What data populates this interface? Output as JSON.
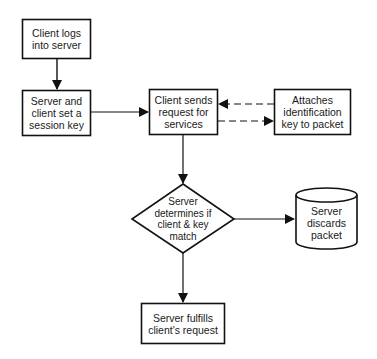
{
  "diagram": {
    "type": "flowchart",
    "nodes": {
      "login": {
        "shape": "rect",
        "lines": [
          "Client logs",
          "into server"
        ]
      },
      "session": {
        "shape": "rect",
        "lines": [
          "Server and",
          "client set a",
          "session key"
        ]
      },
      "request": {
        "shape": "rect",
        "lines": [
          "Client sends",
          "request for",
          "services"
        ]
      },
      "attach": {
        "shape": "rect",
        "lines": [
          "Attaches",
          "identification",
          "key to packet"
        ]
      },
      "decision": {
        "shape": "diamond",
        "lines": [
          "Server",
          "determines if",
          "client & key",
          "match"
        ]
      },
      "discard": {
        "shape": "cylinder",
        "lines": [
          "Server",
          "discards",
          "packet"
        ]
      },
      "fulfill": {
        "shape": "rect",
        "lines": [
          "Server fulfills",
          "client's request"
        ]
      }
    },
    "edges": [
      {
        "from": "login",
        "to": "session",
        "style": "solid"
      },
      {
        "from": "session",
        "to": "request",
        "style": "solid"
      },
      {
        "from": "attach",
        "to": "request",
        "style": "dashed"
      },
      {
        "from": "request",
        "to": "attach",
        "style": "dashed"
      },
      {
        "from": "request",
        "to": "decision",
        "style": "solid"
      },
      {
        "from": "decision",
        "to": "discard",
        "style": "solid"
      },
      {
        "from": "decision",
        "to": "fulfill",
        "style": "solid"
      }
    ],
    "colors": {
      "stroke": "#111111",
      "fill": "#ffffff",
      "text": "#1a1a1a"
    }
  }
}
